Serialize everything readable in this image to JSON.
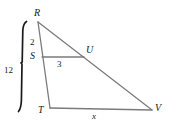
{
  "figure": {
    "background_color": "#ffffff",
    "line_color": "#7b7b7b",
    "bracket_color": "#1a1a1a",
    "label_color": "#1a1a1a"
  },
  "vertices": {
    "R": {
      "label": "R",
      "x": 38,
      "y": 22
    },
    "S": {
      "label": "S",
      "x": 42,
      "y": 57
    },
    "T": {
      "label": "T",
      "x": 50,
      "y": 108
    },
    "U": {
      "label": "U",
      "x": 84,
      "y": 57
    },
    "V": {
      "label": "V",
      "x": 152,
      "y": 110
    }
  },
  "measurements": {
    "RS": {
      "label": "2",
      "value": 2,
      "segment": "R-S"
    },
    "SU": {
      "label": "3",
      "value": 3,
      "segment": "S-U"
    },
    "RT": {
      "label": "12",
      "value": 12,
      "segment": "R-T"
    },
    "TV": {
      "label": "x",
      "value": "x",
      "segment": "T-V"
    }
  },
  "segments": [
    {
      "name": "R-V",
      "from": "R",
      "to": "V"
    },
    {
      "name": "R-T",
      "from": "R",
      "to": "T"
    },
    {
      "name": "T-V",
      "from": "T",
      "to": "V"
    },
    {
      "name": "S-U",
      "from": "S",
      "to": "U"
    }
  ],
  "bracket": {
    "name": "rt-length-bracket",
    "label": "12",
    "spans": "R-T"
  }
}
